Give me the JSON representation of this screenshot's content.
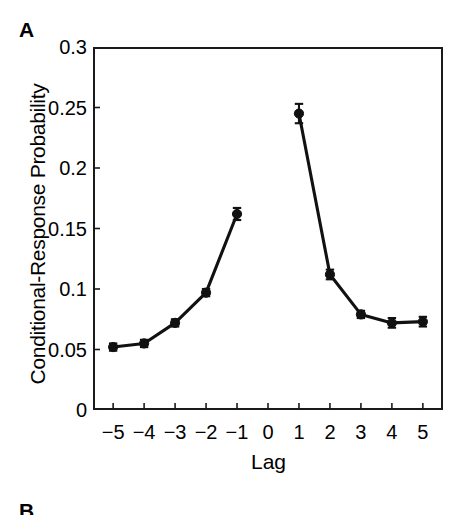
{
  "panels": {
    "a_letter": "A",
    "b_letter": "B"
  },
  "chart_data": {
    "type": "line",
    "title": "",
    "xlabel": "Lag",
    "ylabel": "Conditional-Response Probability",
    "xlim": [
      -5.65,
      5.65
    ],
    "ylim": [
      0,
      0.3
    ],
    "grid": false,
    "legend": "none",
    "marker": "filled-circle",
    "error_bars": "vertical",
    "xtick_labels": [
      "−5",
      "−4",
      "−3",
      "−2",
      "−1",
      "0",
      "1",
      "2",
      "3",
      "4",
      "5"
    ],
    "ytick_labels": [
      "0",
      "0.05",
      "0.1",
      "0.15",
      "0.2",
      "0.25",
      "0.3"
    ],
    "ytick_values": [
      0,
      0.05,
      0.1,
      0.15,
      0.2,
      0.25,
      0.3
    ],
    "series": [
      {
        "name": "Backward lags",
        "x": [
          -5,
          -4,
          -3,
          -2,
          -1
        ],
        "values": [
          0.052,
          0.055,
          0.072,
          0.097,
          0.162
        ],
        "errors": [
          0.003,
          0.003,
          0.003,
          0.003,
          0.005
        ]
      },
      {
        "name": "Forward lags",
        "x": [
          1,
          2,
          3,
          4,
          5
        ],
        "values": [
          0.245,
          0.112,
          0.079,
          0.072,
          0.073
        ],
        "errors": [
          0.008,
          0.004,
          0.003,
          0.004,
          0.004
        ]
      }
    ],
    "gap_at_x": 0,
    "annotations": []
  }
}
